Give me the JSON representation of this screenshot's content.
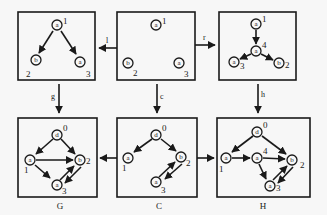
{
  "diagram": {
    "colors": {
      "stroke": "#1a1a1a",
      "background": "#f7f7f7"
    },
    "transitions": [
      {
        "id": "l",
        "label": "l",
        "from": "top_center",
        "to": "top_left"
      },
      {
        "id": "r",
        "label": "r",
        "from": "top_center",
        "to": "top_right"
      },
      {
        "id": "g",
        "label": "g",
        "from": "top_left",
        "to": "G"
      },
      {
        "id": "c",
        "label": "c",
        "from": "top_center",
        "to": "C"
      },
      {
        "id": "h",
        "label": "h",
        "from": "top_right",
        "to": "H"
      },
      {
        "id": "cg",
        "label": "",
        "from": "C",
        "to": "G"
      },
      {
        "id": "ch",
        "label": "",
        "from": "C",
        "to": "H"
      }
    ],
    "panels": {
      "top_left": {
        "caption": "",
        "nodes": [
          {
            "id": "n1",
            "letter": "a",
            "index": "1"
          },
          {
            "id": "n2",
            "letter": "b",
            "index": "2"
          },
          {
            "id": "n3",
            "letter": "a",
            "index": "3"
          }
        ],
        "edges": [
          [
            "n1",
            "n2"
          ],
          [
            "n1",
            "n3"
          ]
        ]
      },
      "top_center": {
        "caption": "",
        "nodes": [
          {
            "id": "n1",
            "letter": "a",
            "index": "1"
          },
          {
            "id": "n2",
            "letter": "b",
            "index": "2"
          },
          {
            "id": "n3",
            "letter": "a",
            "index": "3"
          }
        ],
        "edges": []
      },
      "top_right": {
        "caption": "",
        "nodes": [
          {
            "id": "n1",
            "letter": "a",
            "index": "1"
          },
          {
            "id": "n4",
            "letter": "a",
            "index": "4"
          },
          {
            "id": "n3",
            "letter": "a",
            "index": "3"
          },
          {
            "id": "n2",
            "letter": "b",
            "index": "2"
          }
        ],
        "edges": [
          [
            "n1",
            "n4"
          ],
          [
            "n4",
            "n3"
          ],
          [
            "n4",
            "n2"
          ]
        ]
      },
      "G": {
        "caption": "G",
        "nodes": [
          {
            "id": "n0",
            "letter": "d",
            "index": "0"
          },
          {
            "id": "n1",
            "letter": "a",
            "index": "1"
          },
          {
            "id": "n2",
            "letter": "b",
            "index": "2"
          },
          {
            "id": "n3",
            "letter": "a",
            "index": "3"
          }
        ],
        "edges": [
          [
            "n0",
            "n1"
          ],
          [
            "n0",
            "n2"
          ],
          [
            "n1",
            "n2"
          ],
          [
            "n1",
            "n3"
          ],
          [
            "n3",
            "n2"
          ],
          [
            "n2",
            "n3"
          ]
        ]
      },
      "C": {
        "caption": "C",
        "nodes": [
          {
            "id": "n0",
            "letter": "d",
            "index": "0"
          },
          {
            "id": "n1",
            "letter": "a",
            "index": "1"
          },
          {
            "id": "n2",
            "letter": "b",
            "index": "2"
          },
          {
            "id": "n3",
            "letter": "a",
            "index": "3"
          }
        ],
        "edges": [
          [
            "n0",
            "n1"
          ],
          [
            "n0",
            "n2"
          ],
          [
            "n3",
            "n2"
          ],
          [
            "n2",
            "n3"
          ]
        ]
      },
      "H": {
        "caption": "H",
        "nodes": [
          {
            "id": "n0",
            "letter": "d",
            "index": "0"
          },
          {
            "id": "n1",
            "letter": "a",
            "index": "1"
          },
          {
            "id": "n4",
            "letter": "a",
            "index": "4"
          },
          {
            "id": "n2",
            "letter": "b",
            "index": "2"
          },
          {
            "id": "n3",
            "letter": "a",
            "index": "3"
          }
        ],
        "edges": [
          [
            "n0",
            "n1"
          ],
          [
            "n0",
            "n2"
          ],
          [
            "n1",
            "n4"
          ],
          [
            "n4",
            "n2"
          ],
          [
            "n4",
            "n3"
          ],
          [
            "n3",
            "n2"
          ],
          [
            "n2",
            "n3"
          ]
        ]
      }
    }
  }
}
